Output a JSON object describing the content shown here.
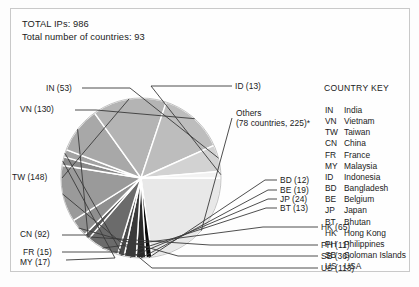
{
  "header": {
    "total_ips_label": "TOTAL IPs: 986",
    "total_countries_label": "Total number of countries: 93",
    "total_ips": 986,
    "total_countries": 93
  },
  "country_key": {
    "title": "COUNTRY KEY",
    "entries": [
      {
        "code": "IN",
        "name": "India"
      },
      {
        "code": "VN",
        "name": "Vietnam"
      },
      {
        "code": "TW",
        "name": "Taiwan"
      },
      {
        "code": "CN",
        "name": "China"
      },
      {
        "code": "FR",
        "name": "France"
      },
      {
        "code": "MY",
        "name": "Malaysia"
      },
      {
        "code": "ID",
        "name": "Indonesia"
      },
      {
        "code": "BD",
        "name": "Bangladesh"
      },
      {
        "code": "BE",
        "name": "Belgium"
      },
      {
        "code": "JP",
        "name": "Japan"
      },
      {
        "code": "BT",
        "name": "Bhutan"
      },
      {
        "code": "HK",
        "name": "Hong Kong"
      },
      {
        "code": "PH",
        "name": "Philippines"
      },
      {
        "code": "SB",
        "name": "Soloman Islands"
      },
      {
        "code": "US",
        "name": "USA"
      }
    ]
  },
  "callouts": {
    "in": "IN (53)",
    "vn": "VN (130)",
    "tw": "TW (148)",
    "cn": "CN (92)",
    "fr": "FR (15)",
    "my": "MY (17)",
    "id": "ID (13)",
    "others_line1": "Others",
    "others_line2": "(78 countries, 225)*",
    "bd": "BD (12)",
    "be": "BE (19)",
    "jp": "JP (24)",
    "bt": "BT (13)",
    "hk": "HK (65)",
    "ph": "PH (11)",
    "sb": "SB (36)",
    "us": "US (113)"
  },
  "chart_data": {
    "type": "pie",
    "title": "",
    "total": 986,
    "units": "IP addresses",
    "start_angle_deg": 0,
    "direction": "clockwise",
    "legend_position": "right",
    "grid": false,
    "center": {
      "x": 141,
      "y": 178
    },
    "radius": 80,
    "categories": [
      "Others",
      "BD",
      "BE",
      "JP",
      "BT",
      "HK",
      "PH",
      "SB",
      "US",
      "MY",
      "FR",
      "CN",
      "TW",
      "VN",
      "IN",
      "ID"
    ],
    "values": [
      225,
      12,
      19,
      24,
      13,
      65,
      11,
      36,
      113,
      17,
      15,
      92,
      148,
      130,
      53,
      13
    ],
    "labels": [
      "Others (78 countries, 225)*",
      "BD (12)",
      "BE (19)",
      "JP (24)",
      "BT (13)",
      "HK (65)",
      "PH (11)",
      "SB (36)",
      "US (113)",
      "MY (17)",
      "FR (15)",
      "CN (92)",
      "TW (148)",
      "VN (130)",
      "IN (53)",
      "ID (13)"
    ],
    "colors": [
      "#e8e8e8",
      "#0a0a0a",
      "#2a2a2a",
      "#3a3a3a",
      "#4a4a4a",
      "#6b6b6b",
      "#5a5a5a",
      "#8f8f8f",
      "#9a9a9a",
      "#8a8a8a",
      "#a2a2a2",
      "#a8a8a8",
      "#b4b4b4",
      "#bdbdbd",
      "#d2d2d2",
      "#f2f2f2"
    ],
    "slice_colors_hex": {
      "Others": "#e8e8e8",
      "BD": "#0a0a0a",
      "BE": "#2a2a2a",
      "JP": "#3a3a3a",
      "BT": "#4a4a4a",
      "HK": "#6b6b6b",
      "PH": "#5a5a5a",
      "SB": "#8f8f8f",
      "US": "#9a9a9a",
      "MY": "#8a8a8a",
      "FR": "#a2a2a2",
      "CN": "#a8a8a8",
      "TW": "#b4b4b4",
      "VN": "#bdbdbd",
      "IN": "#d2d2d2",
      "ID": "#f2f2f2"
    },
    "footnote": "*"
  },
  "style": {
    "border_color": "#c9c9c9",
    "background": "#fefefe",
    "leader_color": "#3a3a3a",
    "slice_gap_color": "#ffffff"
  }
}
